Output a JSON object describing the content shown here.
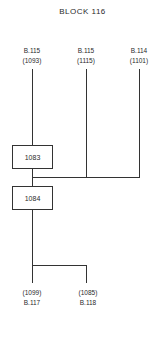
{
  "title": "BLOCK 116",
  "sources": [
    {
      "block": "B.115",
      "lot": "(1093)"
    },
    {
      "block": "B.115",
      "lot": "(1115)"
    },
    {
      "block": "B.114",
      "lot": "(1101)"
    }
  ],
  "boxes": [
    {
      "label": "1083"
    },
    {
      "label": "1084"
    }
  ],
  "outputs": [
    {
      "lot": "(1099)",
      "block": "B.117"
    },
    {
      "lot": "(1085)",
      "block": "B.118"
    }
  ]
}
